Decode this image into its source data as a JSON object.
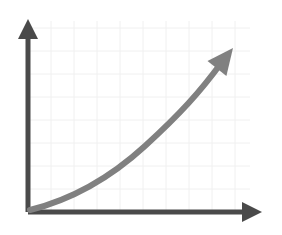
{
  "chart_data": {
    "type": "line",
    "title": "",
    "subtitle": "",
    "xlabel": "",
    "ylabel": "",
    "grid": true,
    "legend": null,
    "legend_position": "none",
    "axis_tick_labels_x": [],
    "axis_tick_labels_y": [],
    "annotations": [],
    "xlim": [
      0,
      10
    ],
    "ylim": [
      0,
      8
    ],
    "grid_step_x": 1,
    "grid_step_y": 1,
    "series": [
      {
        "name": "growth",
        "shape": "exponential-upward",
        "x": [
          0,
          1,
          2,
          3,
          4,
          5,
          6,
          7,
          8,
          8.9
        ],
        "y": [
          0.1,
          0.35,
          0.7,
          1.1,
          1.6,
          2.2,
          3.0,
          4.0,
          5.4,
          7.1
        ],
        "has_arrow_head": true
      }
    ],
    "axes": {
      "x_axis_has_arrow": true,
      "y_axis_has_arrow": true
    }
  },
  "geometry": {
    "origin_x": 28,
    "origin_y": 212,
    "y_axis_top": 19,
    "x_axis_right": 262,
    "grid_left": 28,
    "grid_right": 250,
    "grid_top": 21,
    "grid_bottom": 212,
    "grid_spacing": 23,
    "curve_path": "M 30 210 C 70 200, 110 178, 145 146 S 200 92, 222 62",
    "curve_arrow_tip_x": 233,
    "curve_arrow_tip_y": 48
  },
  "colors": {
    "background": "#ffffff",
    "grid_line": "#f0f0f0",
    "axis": "#4a4a4a",
    "curve": "#808080"
  },
  "strokes": {
    "axis_width": 5,
    "curve_width": 6,
    "grid_width": 1
  }
}
